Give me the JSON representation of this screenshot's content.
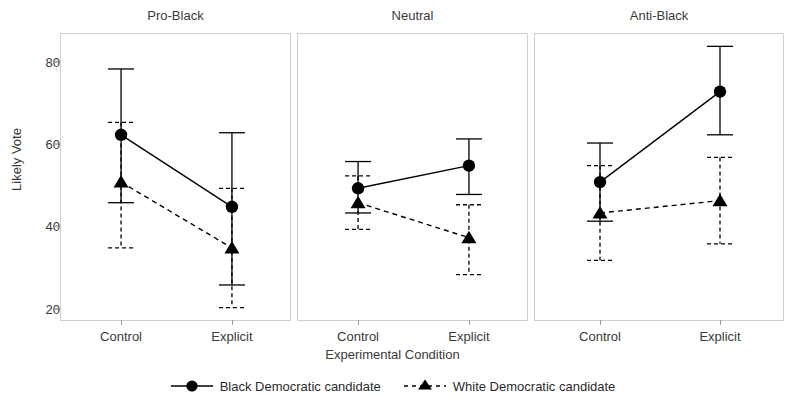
{
  "chart_data": {
    "type": "line",
    "title": "",
    "xlabel": "Experimental Condition",
    "ylabel": "Likely Vote",
    "ylim": [
      17,
      87
    ],
    "yticks": [
      20,
      40,
      60,
      80
    ],
    "ytick_labels": [
      "20",
      "40",
      "60",
      "80"
    ],
    "categories": [
      "Control",
      "Explicit"
    ],
    "grid": false,
    "legend_position": "bottom",
    "panels": [
      {
        "label": "Pro-Black",
        "series": [
          {
            "name": "Black Democratic candidate",
            "marker": "circle",
            "line": "solid",
            "values": [
              62.5,
              45.0
            ],
            "ci_low": [
              46.0,
              26.0
            ],
            "ci_high": [
              78.5,
              63.0
            ]
          },
          {
            "name": "White Democratic candidate",
            "marker": "triangle",
            "line": "dashed",
            "values": [
              51.0,
              35.0
            ],
            "ci_low": [
              35.0,
              20.5
            ],
            "ci_high": [
              65.5,
              49.5
            ]
          }
        ]
      },
      {
        "label": "Neutral",
        "series": [
          {
            "name": "Black Democratic candidate",
            "marker": "circle",
            "line": "solid",
            "values": [
              49.5,
              55.0
            ],
            "ci_low": [
              43.5,
              48.0
            ],
            "ci_high": [
              56.0,
              61.5
            ]
          },
          {
            "name": "White Democratic candidate",
            "marker": "triangle",
            "line": "dashed",
            "values": [
              46.0,
              37.5
            ],
            "ci_low": [
              39.5,
              28.5
            ],
            "ci_high": [
              52.5,
              45.5
            ]
          }
        ]
      },
      {
        "label": "Anti-Black",
        "series": [
          {
            "name": "Black Democratic candidate",
            "marker": "circle",
            "line": "solid",
            "values": [
              51.0,
              73.0
            ],
            "ci_low": [
              41.5,
              62.5
            ],
            "ci_high": [
              60.5,
              84.0
            ]
          },
          {
            "name": "White Democratic candidate",
            "marker": "triangle",
            "line": "dashed",
            "values": [
              43.5,
              46.5
            ],
            "ci_low": [
              32.0,
              36.0
            ],
            "ci_high": [
              55.0,
              57.0
            ]
          }
        ]
      }
    ],
    "legend": [
      {
        "label": "Black Democratic candidate",
        "marker": "circle",
        "line": "solid"
      },
      {
        "label": "White Democratic candidate",
        "marker": "triangle",
        "line": "dashed"
      }
    ],
    "colors": {
      "ink": "#000000",
      "axis": "#9a9a9a",
      "panel_border": "#cfcfcf",
      "text": "#3a3a3a",
      "background": "#ffffff"
    }
  }
}
